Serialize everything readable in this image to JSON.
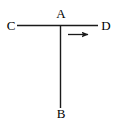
{
  "figure": {
    "background_color": "#ffffff",
    "stroke_color": "#1a1a1a",
    "label_color": "#000000",
    "width": 120,
    "height": 133,
    "labels": {
      "a": "A",
      "b": "B",
      "c": "C",
      "d": "D"
    },
    "segments": [
      {
        "name": "horizontal-segment-CD",
        "from": "C",
        "to": "D",
        "x1": 17,
        "y1": 25.5,
        "x2": 98,
        "y2": 25.5
      },
      {
        "name": "vertical-segment-AB",
        "from": "A",
        "to": "B",
        "x1": 60.5,
        "y1": 25.5,
        "x2": 60.5,
        "y2": 108
      }
    ],
    "arrow": {
      "name": "direction-arrow",
      "direction": "right",
      "x1": 68,
      "y1": 34.5,
      "x2": 92,
      "y2": 34.5
    },
    "points": {
      "A": {
        "x": 60.5,
        "y": 25.5
      },
      "B": {
        "x": 60.5,
        "y": 108
      },
      "C": {
        "x": 17,
        "y": 25.5
      },
      "D": {
        "x": 98,
        "y": 25.5
      }
    }
  }
}
